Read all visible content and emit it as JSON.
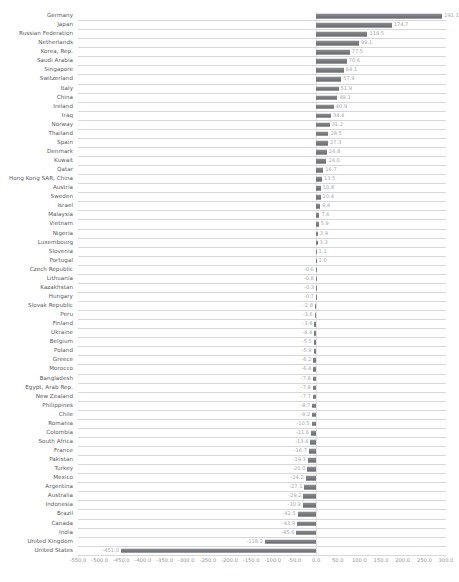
{
  "chart_data": {
    "type": "bar",
    "orientation": "horizontal",
    "title": "",
    "subtitle": "",
    "xlabel": "",
    "ylabel": "",
    "xlim": [
      -550.0,
      300.0
    ],
    "xticks": [
      "-550.0",
      "-500.0",
      "-450.0",
      "-400.0",
      "-350.0",
      "-300.0",
      "-250.0",
      "-200.0",
      "-150.0",
      "-100.0",
      "-50.0",
      "0.0",
      "50.0",
      "100.0",
      "150.0",
      "200.0",
      "250.0",
      "300.0"
    ],
    "xtick_values": [
      -550,
      -500,
      -450,
      -400,
      -350,
      -300,
      -250,
      -200,
      -150,
      -100,
      -50,
      0,
      50,
      100,
      150,
      200,
      250,
      300
    ],
    "grid": true,
    "grid_axis": "y",
    "legend": "none",
    "bar_color": "#808285",
    "label_color": "#a7a9ac",
    "category_color": "#58585a",
    "categories": [
      "Germany",
      "Japan",
      "Russian Federation",
      "Netherlands",
      "Korea, Rep.",
      "Saudi Arabia",
      "Singapore",
      "Switzerland",
      "Italy",
      "China",
      "Ireland",
      "Iraq",
      "Norway",
      "Thailand",
      "Spain",
      "Denmark",
      "Kuwait",
      "Qatar",
      "Hong Kong SAR, China",
      "Austria",
      "Sweden",
      "Israel",
      "Malaysia",
      "Vietnam",
      "Nigeria",
      "Luxembourg",
      "Slovenia",
      "Portugal",
      "Czech Republic",
      "Lithuania",
      "Kazakhstan",
      "Hungary",
      "Slovak Republic",
      "Peru",
      "Finland",
      "Ukraine",
      "Belgium",
      "Poland",
      "Greece",
      "Morocco",
      "Bangladesh",
      "Egypt, Arab Rep.",
      "New Zealand",
      "Philippines",
      "Chile",
      "Romania",
      "Colombia",
      "South Africa",
      "France",
      "Pakistan",
      "Turkey",
      "Mexico",
      "Argentina",
      "Australia",
      "Indonesia",
      "Brazil",
      "Canada",
      "India",
      "United Kingdom",
      "United States"
    ],
    "values": [
      291.1,
      174.7,
      118.5,
      99.1,
      77.5,
      70.6,
      64.1,
      57.9,
      51.9,
      49.1,
      40.9,
      34.4,
      31.2,
      28.5,
      27.3,
      24.8,
      24.0,
      16.7,
      13.5,
      10.8,
      10.4,
      9.4,
      7.6,
      5.9,
      3.9,
      3.3,
      1.1,
      1.0,
      -0.6,
      -0.8,
      -0.3,
      -0.7,
      -2.8,
      -3.6,
      -3.8,
      -4.4,
      -5.5,
      -5.9,
      -6.2,
      -6.4,
      -7.8,
      -7.8,
      -7.7,
      -8.7,
      -9.2,
      -10.5,
      -11.6,
      -13.4,
      -16.7,
      -19.3,
      -20.0,
      -24.2,
      -27.1,
      -29.2,
      -30.9,
      -42.5,
      -43.9,
      -45.6,
      -118.2,
      -451.0
    ],
    "value_labels": [
      "291.1",
      "174.7",
      "118.5",
      "99.1",
      "77.5",
      "70.6",
      "64.1",
      "57.9",
      "51.9",
      "49.1",
      "40.9",
      "34.4",
      "31.2",
      "28.5",
      "27.3",
      "24.8",
      "24.0",
      "16.7",
      "13.5",
      "10.8",
      "10.4",
      "9.4",
      "7.6",
      "5.9",
      "3.9",
      "3.3",
      "1.1",
      "1.0",
      "-0.6",
      "-0.8",
      "-0.3",
      "-0.7",
      "-2.8",
      "-3.6",
      "-3.8",
      "-4.4",
      "-5.5",
      "-5.9",
      "-6.2",
      "-6.4",
      "-7.8",
      "-7.8",
      "-7.7",
      "-8.7",
      "-9.2",
      "-10.5",
      "-11.6",
      "-13.4",
      "-16.7",
      "-19.3",
      "-20.0",
      "-24.2",
      "-27.1",
      "-29.2",
      "-30.9",
      "-42.5",
      "-43.9",
      "-45.6",
      "-118.2",
      "-451.0"
    ]
  }
}
